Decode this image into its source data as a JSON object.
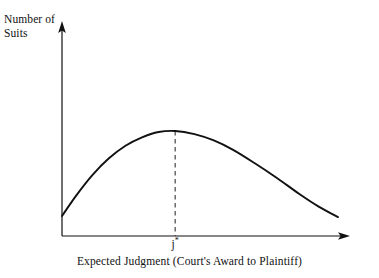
{
  "figure": {
    "name": "number-of-suits-vs-expected-judgment",
    "background_color": "#ffffff",
    "line_color": "#111111"
  },
  "labels": {
    "y_axis_label": "Number of\nSuits",
    "y_axis_label_line1": "Number of",
    "y_axis_label_line2": "Suits",
    "x_axis_caption": "Expected Judgment (Court's Award to Plaintiff)",
    "x_tick_label_base": "j",
    "x_tick_label_superscript": "*"
  },
  "chart_data": {
    "type": "line",
    "title": "",
    "subtitle": "",
    "xlabel": "Expected Judgment (Court's Award to Plaintiff)",
    "ylabel": "Number of Suits",
    "grid": false,
    "legend": false,
    "legend_position": "none",
    "xlim": [
      0,
      100
    ],
    "ylim": [
      0,
      100
    ],
    "x_tick_labels": [
      "j*"
    ],
    "x_tick_values": [
      41
    ],
    "y_tick_labels": [],
    "y_tick_values": [],
    "axis_style": {
      "x_axis_arrow": true,
      "y_axis_arrow": true,
      "spines": [
        "left",
        "bottom"
      ]
    },
    "annotations": [
      {
        "name": "peak-dashed-dropline",
        "type": "vertical-dashed-line",
        "x": 41,
        "y_from": 0,
        "y_to": 100,
        "label": "j*"
      }
    ],
    "series": [
      {
        "name": "Number of Suits",
        "style": "smooth-concave-curve",
        "x": [
          0,
          5,
          11,
          17,
          23,
          29,
          35,
          41,
          48,
          55,
          62,
          70,
          78,
          86,
          93,
          100
        ],
        "values": [
          19,
          38,
          58,
          74,
          86,
          94,
          99,
          100,
          97,
          91,
          82,
          69,
          55,
          40,
          28,
          18
        ]
      }
    ]
  }
}
